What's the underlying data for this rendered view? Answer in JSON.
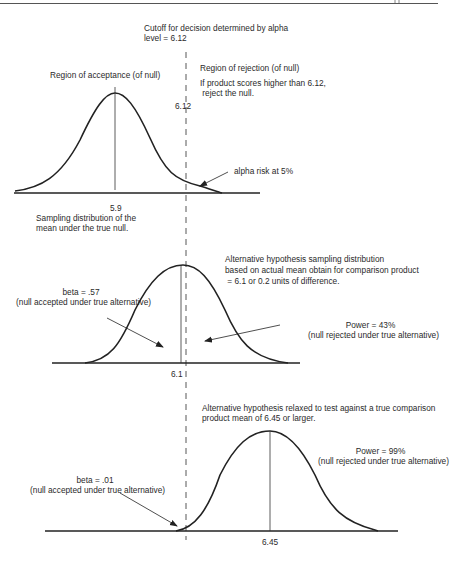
{
  "page": {
    "page_marker": "..."
  },
  "cutoff": {
    "line1": "Cutoff for decision determined by alpha",
    "line2": "level = 6.12",
    "value_label": "6.12"
  },
  "panel_null": {
    "region_acceptance": "Region of acceptance (of null)",
    "region_rejection": "Region of rejection (of null)",
    "rule_line1": "If product scores higher than 6.12,",
    "rule_line2": " reject the null.",
    "alpha_label": "alpha risk at 5%",
    "mean_label": "5.9",
    "caption_line1": "Sampling distribution of the",
    "caption_line2": "mean under the true null."
  },
  "panel_alt1": {
    "desc_line1": "Alternative hypothesis sampling distribution",
    "desc_line2": "based on actual mean obtain for comparison product",
    "desc_line3": " = 6.1 or 0.2 units of difference.",
    "beta_line1": "beta = .57",
    "beta_line2": "(null accepted under true alternative)",
    "power_line1": "Power = 43%",
    "power_line2": "(null rejected under true alternative)",
    "mean_label": "6.1"
  },
  "panel_alt2": {
    "desc_line1": "Alternative hypothesis relaxed to test against a true comparison",
    "desc_line2": "product mean of 6.45 or larger.",
    "beta_line1": "beta = .01",
    "beta_line2": "(null accepted under true alternative)",
    "power_line1": "Power = 99%",
    "power_line2": "(null rejected under true alternative)",
    "mean_label": "6.45"
  },
  "colors": {
    "ink": "#2a2a2a",
    "background": "#ffffff"
  }
}
